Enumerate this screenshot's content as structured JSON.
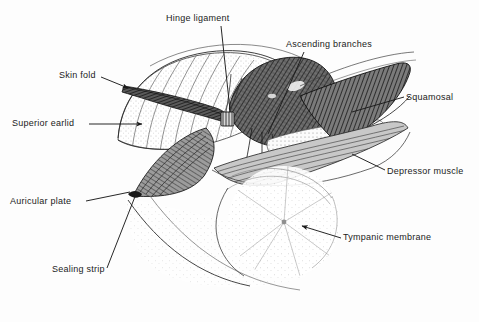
{
  "figure": {
    "background_color": "#fdfdfd",
    "ink_color": "#1b1b1b",
    "labels": [
      {
        "id": "hinge-ligament",
        "text": "Hinge ligament",
        "x": 166,
        "y": 18,
        "anchor": "start"
      },
      {
        "id": "skin-fold",
        "text": "Skin fold",
        "x": 59,
        "y": 74,
        "anchor": "start"
      },
      {
        "id": "superior-earlid",
        "text": "Superior earlid",
        "x": 12,
        "y": 121,
        "anchor": "start"
      },
      {
        "id": "auricular-plate",
        "text": "Auricular plate",
        "x": 10,
        "y": 200,
        "anchor": "start"
      },
      {
        "id": "sealing-strip",
        "text": "Sealing strip",
        "x": 52,
        "y": 268,
        "anchor": "start"
      },
      {
        "id": "ascending-branches",
        "text": "Ascending branches",
        "x": 286,
        "y": 44,
        "anchor": "start"
      },
      {
        "id": "squamosal",
        "text": "Squamosal",
        "x": 406,
        "y": 96,
        "anchor": "start"
      },
      {
        "id": "depressor-muscle",
        "text": "Depressor muscle",
        "x": 387,
        "y": 170,
        "anchor": "start"
      },
      {
        "id": "tympanic-membrane",
        "text": "Tympanic membrane",
        "x": 343,
        "y": 236,
        "anchor": "start"
      }
    ],
    "structures": [
      {
        "id": "superior-earlid-dome",
        "kind": "stippled-striated-dome"
      },
      {
        "id": "skin-fold-band",
        "kind": "dark-hatched-band"
      },
      {
        "id": "hinge-ligament-node",
        "kind": "small-hatched-node"
      },
      {
        "id": "auricular-plate-wedge",
        "kind": "cross-hatched-wedge"
      },
      {
        "id": "ascending-branches-mass",
        "kind": "dense-cross-hatch-mass"
      },
      {
        "id": "squamosal-band",
        "kind": "dark-tapering-band"
      },
      {
        "id": "depressor-muscle-band",
        "kind": "striated-band"
      },
      {
        "id": "tympanic-membrane-disc",
        "kind": "stippled-radial-disc"
      },
      {
        "id": "ear-canal-cavity",
        "kind": "light-cavity"
      }
    ]
  }
}
